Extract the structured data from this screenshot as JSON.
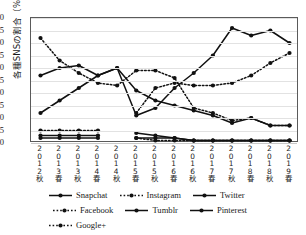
{
  "chart_data": {
    "type": "line",
    "title": "",
    "xlabel": "",
    "ylabel": "各種SNSの割合（%）",
    "ylim": [
      0,
      50
    ],
    "yticks": [
      0,
      5,
      10,
      15,
      20,
      25,
      30,
      35,
      40,
      45,
      50
    ],
    "grid": true,
    "legend_position": "bottom",
    "categories": [
      "2012秋",
      "2013春",
      "2013秋",
      "2014春",
      "2014秋",
      "2015春",
      "2015秋",
      "2016春",
      "2016秋",
      "2017春",
      "2017秋",
      "2018春",
      "2018秋",
      "2019春"
    ],
    "category_parts": [
      [
        "2",
        "0",
        "1",
        "2",
        "秋"
      ],
      [
        "2",
        "0",
        "1",
        "3",
        "春"
      ],
      [
        "2",
        "0",
        "1",
        "3",
        "秋"
      ],
      [
        "2",
        "0",
        "1",
        "4",
        "春"
      ],
      [
        "2",
        "0",
        "1",
        "4",
        "秋"
      ],
      [
        "2",
        "0",
        "1",
        "5",
        "春"
      ],
      [
        "2",
        "0",
        "1",
        "5",
        "秋"
      ],
      [
        "2",
        "0",
        "1",
        "6",
        "春"
      ],
      [
        "2",
        "0",
        "1",
        "6",
        "秋"
      ],
      [
        "2",
        "0",
        "1",
        "7",
        "春"
      ],
      [
        "2",
        "0",
        "1",
        "7",
        "秋"
      ],
      [
        "2",
        "0",
        "1",
        "8",
        "春"
      ],
      [
        "2",
        "0",
        "1",
        "8",
        "秋"
      ],
      [
        "2",
        "0",
        "1",
        "9",
        "春"
      ]
    ],
    "series": [
      {
        "name": "Snapchat",
        "style": "solid",
        "color": "#111111",
        "values": [
          12,
          17,
          22,
          27,
          30,
          11,
          14,
          22,
          28,
          35,
          46,
          43,
          45,
          40
        ]
      },
      {
        "name": "Instagram",
        "style": "dotted",
        "color": "#111111",
        "values": [
          null,
          null,
          null,
          null,
          null,
          12,
          22,
          24,
          23,
          23,
          24,
          27,
          32,
          36
        ]
      },
      {
        "name": "Twitter",
        "style": "solid",
        "color": "#111111",
        "values": [
          27,
          30,
          31,
          27,
          30,
          21,
          17,
          15,
          13,
          11,
          8,
          10,
          7,
          7
        ]
      },
      {
        "name": "Facebook",
        "style": "dotted",
        "color": "#111111",
        "values": [
          42,
          33,
          28,
          24,
          23,
          29,
          29,
          26,
          14,
          12,
          9,
          10,
          7,
          7
        ]
      },
      {
        "name": "Tumblr",
        "style": "solid",
        "color": "#111111",
        "values": [
          3,
          3,
          3,
          3,
          null,
          4,
          3,
          2,
          1,
          1,
          1,
          1,
          1,
          1
        ]
      },
      {
        "name": "Pinterest",
        "style": "solid",
        "color": "#111111",
        "values": [
          2,
          2,
          2,
          2,
          null,
          2,
          2,
          2,
          1,
          1,
          1,
          1,
          1,
          1
        ]
      },
      {
        "name": "Google+",
        "style": "dotted",
        "color": "#111111",
        "values": [
          5,
          5,
          5,
          5,
          null,
          2,
          1,
          1,
          1,
          1,
          1,
          1,
          1,
          1
        ]
      }
    ]
  },
  "legend": {
    "rows": [
      [
        {
          "label": "Snapchat",
          "style": "solid"
        },
        {
          "label": "Instagram",
          "style": "dotted"
        },
        {
          "label": "Twitter",
          "style": "solid"
        }
      ],
      [
        {
          "label": "Facebook",
          "style": "dotted"
        },
        {
          "label": "Tumblr",
          "style": "solid"
        },
        {
          "label": "Pinterest",
          "style": "solid"
        }
      ],
      [
        {
          "label": "Google+",
          "style": "dotted"
        }
      ]
    ]
  }
}
